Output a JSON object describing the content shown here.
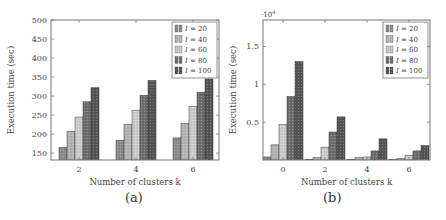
{
  "chart_data": [
    {
      "type": "bar",
      "panel_label": "(a)",
      "title": "",
      "xlabel": "Number of clusters k",
      "ylabel": "Execution time (sec)",
      "categories": [
        "2",
        "4",
        "6"
      ],
      "ylim": [
        132,
        500
      ],
      "yticks": [
        150,
        200,
        250,
        300,
        350,
        400,
        450,
        500
      ],
      "grid": false,
      "legend_position": "upper right",
      "series": [
        {
          "name": "I = 20",
          "color": "#8c8c8c",
          "values": [
            165,
            184,
            190
          ]
        },
        {
          "name": "I = 40",
          "color": "#b4b4b4",
          "values": [
            207,
            225,
            228
          ]
        },
        {
          "name": "I = 60",
          "color": "#cdcdcd",
          "values": [
            245,
            263,
            272
          ]
        },
        {
          "name": "I = 80",
          "color": "#6e6e6e",
          "values": [
            285,
            302,
            310
          ]
        },
        {
          "name": "I = 100",
          "color": "#555555",
          "values": [
            322,
            341,
            345
          ]
        }
      ]
    },
    {
      "type": "bar",
      "panel_label": "(b)",
      "title": "",
      "xlabel": "Number of clusters k",
      "ylabel": "Execution time (sec)",
      "y_multiplier": "·10^4",
      "categories": [
        "0",
        "2",
        "4",
        "6"
      ],
      "ylim": [
        0,
        1.85
      ],
      "yticks": [
        0.5,
        1,
        1.5
      ],
      "grid": false,
      "legend_position": "upper right",
      "series": [
        {
          "name": "I = 20",
          "color": "#8c8c8c",
          "values": [
            0.04,
            0.01,
            0.005,
            0.005
          ]
        },
        {
          "name": "I = 40",
          "color": "#b4b4b4",
          "values": [
            0.2,
            0.03,
            0.03,
            0.02
          ]
        },
        {
          "name": "I = 60",
          "color": "#cdcdcd",
          "values": [
            0.47,
            0.17,
            0.04,
            0.06
          ]
        },
        {
          "name": "I = 80",
          "color": "#6e6e6e",
          "values": [
            0.84,
            0.37,
            0.12,
            0.12
          ]
        },
        {
          "name": "I = 100",
          "color": "#555555",
          "values": [
            1.3,
            0.57,
            0.28,
            0.19
          ]
        }
      ]
    }
  ]
}
